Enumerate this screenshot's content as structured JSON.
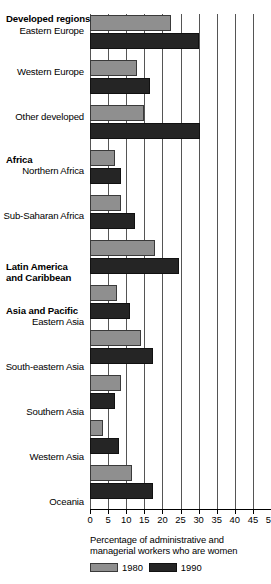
{
  "chart_data": {
    "type": "bar",
    "orientation": "horizontal",
    "title": "",
    "xlabel": "Percentage of administrative and managerial workers who are women",
    "ylabel": "",
    "xlim": [
      0,
      50
    ],
    "xticks": [
      0,
      5,
      10,
      15,
      20,
      25,
      30,
      35,
      40,
      45,
      50
    ],
    "grid": true,
    "legend_position": "bottom-left",
    "series": [
      {
        "name": "1980",
        "color": "#8f8f8f"
      },
      {
        "name": "1990",
        "color": "#252525"
      }
    ],
    "groups": [
      {
        "group": "Developed regions",
        "categories": [
          "Eastern Europe",
          "Western Europe",
          "Other developed"
        ],
        "values_1980": [
          22.5,
          13.0,
          15.0
        ],
        "values_1990": [
          30.0,
          16.5,
          30.5
        ]
      },
      {
        "group": "Africa",
        "categories": [
          "Northern Africa",
          "Sub-Saharan Africa"
        ],
        "values_1980": [
          6.8,
          8.5
        ],
        "values_1990": [
          8.6,
          12.5
        ]
      },
      {
        "group": "Latin America and Caribbean",
        "categories": [
          ""
        ],
        "values_1980": [
          18.0
        ],
        "values_1990": [
          24.5
        ]
      },
      {
        "group": "Asia and Pacific",
        "categories": [
          "Eastern Asia",
          "South-eastern Asia",
          "Southern Asia",
          "Western Asia",
          "Oceania"
        ],
        "values_1980": [
          7.5,
          14.0,
          8.5,
          3.5,
          11.5
        ],
        "values_1990": [
          11.0,
          17.5,
          7.0,
          8.0,
          17.5
        ]
      }
    ]
  },
  "axis": {
    "tick_labels": [
      "0",
      "5",
      "10",
      "15",
      "20",
      "25",
      "30",
      "35",
      "40",
      "45",
      "50"
    ]
  },
  "caption": {
    "line1": "Percentage of administrative and",
    "line2": "managerial workers who are women"
  },
  "legend": {
    "items": [
      {
        "label": "1980"
      },
      {
        "label": "1990"
      }
    ]
  },
  "labels": {
    "group_developed": "Developed regions",
    "group_africa": "Africa",
    "group_latin_1": "Latin America",
    "group_latin_2": "and Caribbean",
    "group_asia": "Asia and Pacific",
    "eastern_europe": "Eastern Europe",
    "western_europe": "Western Europe",
    "other_developed": "Other developed",
    "northern_africa": "Northern Africa",
    "sub_saharan_africa": "Sub-Saharan Africa",
    "eastern_asia": "Eastern Asia",
    "south_eastern_asia": "South-eastern Asia",
    "southern_asia": "Southern Asia",
    "western_asia": "Western Asia",
    "oceania": "Oceania"
  }
}
